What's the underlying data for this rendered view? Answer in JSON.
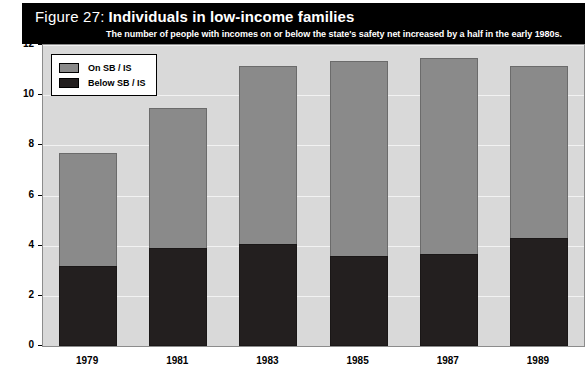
{
  "figure": {
    "label": "Figure 27:",
    "title": "Individuals in low-income families",
    "subtitle": "The number of people with incomes on or below the state's safety net increased by a half in the early 1980s."
  },
  "legend": {
    "items": [
      {
        "label": "On SB / IS",
        "color": "#8a8a8a"
      },
      {
        "label": "Below SB / IS",
        "color": "#231f1f"
      }
    ]
  },
  "colors": {
    "header_background": "#000000",
    "header_text": "#ffffff",
    "plot_background": "#d9d9d9",
    "gridline": "#f2f2f2",
    "series_on": "#8a8a8a",
    "series_below": "#231f1f"
  },
  "chart_data": {
    "type": "bar",
    "stacked": true,
    "title": "Individuals in low-income families",
    "subtitle": "The number of people with incomes on or below the state's safety net increased by a half in the early 1980s.",
    "xlabel": "",
    "ylabel": "Millions of individuals",
    "categories": [
      "1979",
      "1981",
      "1983",
      "1985",
      "1987",
      "1989"
    ],
    "ylim": [
      0,
      12
    ],
    "yticks": [
      0,
      2,
      4,
      6,
      8,
      10,
      12
    ],
    "ytick_labels": [
      "0",
      "2",
      "4",
      "6",
      "8",
      "10",
      "12"
    ],
    "grid": true,
    "legend_position": "top-left",
    "series": [
      {
        "name": "Below SB / IS",
        "color": "#231f1f",
        "values": [
          3.2,
          3.9,
          4.05,
          3.6,
          3.65,
          4.3
        ]
      },
      {
        "name": "On SB / IS",
        "color": "#8a8a8a",
        "values": [
          4.5,
          5.6,
          7.1,
          7.75,
          7.85,
          6.85
        ]
      }
    ],
    "totals": [
      7.7,
      9.5,
      11.15,
      11.35,
      11.5,
      11.15
    ]
  }
}
